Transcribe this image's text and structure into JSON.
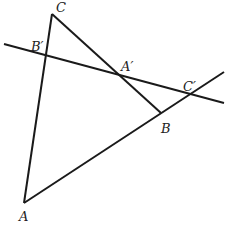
{
  "diagram": {
    "type": "geometry",
    "colors": {
      "stroke": "#1a1a1a",
      "label": "#222222",
      "background": "#ffffff"
    },
    "points": {
      "A": {
        "label": "A",
        "x": 24,
        "y": 203
      },
      "B": {
        "label": "B",
        "x": 161,
        "y": 113
      },
      "C": {
        "label": "C",
        "x": 52,
        "y": 14
      },
      "B_prime": {
        "label": "B′",
        "x": 46,
        "y": 56
      },
      "A_prime": {
        "label": "A′",
        "x": 112,
        "y": 74
      },
      "C_prime": {
        "label": "C′",
        "x": 192,
        "y": 95
      }
    },
    "segments": [
      {
        "name": "side-CA",
        "x1": 52,
        "y1": 14,
        "x2": 24,
        "y2": 203
      },
      {
        "name": "side-CB",
        "x1": 52,
        "y1": 14,
        "x2": 161,
        "y2": 113
      },
      {
        "name": "side-AB-extended",
        "x1": 24,
        "y1": 203,
        "x2": 224,
        "y2": 72
      },
      {
        "name": "transversal",
        "x1": 4,
        "y1": 44,
        "x2": 224,
        "y2": 103
      }
    ],
    "labels": [
      {
        "name": "label-C",
        "text": "C",
        "x": 56,
        "y": 12
      },
      {
        "name": "label-B-prime",
        "text": "B′",
        "x": 31,
        "y": 51
      },
      {
        "name": "label-A-prime",
        "text": "A′",
        "x": 121,
        "y": 71
      },
      {
        "name": "label-C-prime",
        "text": "C′",
        "x": 183,
        "y": 91
      },
      {
        "name": "label-B",
        "text": "B",
        "x": 161,
        "y": 133
      },
      {
        "name": "label-A",
        "text": "A",
        "x": 19,
        "y": 221
      }
    ]
  }
}
